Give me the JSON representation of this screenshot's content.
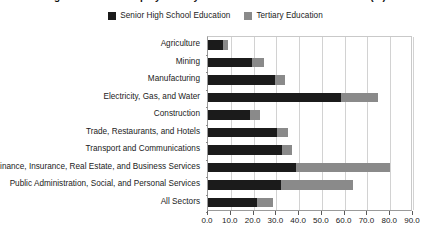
{
  "title": {
    "text": "Figure: Share of Employment by Educational Attainment and Sector (%)"
  },
  "legend": {
    "position": "top-center",
    "items": [
      {
        "label": "Senior High School Education",
        "color": "#1b1b1b",
        "icon": "legend-swatch-icon"
      },
      {
        "label": "Tertiary Education",
        "color": "#8a8a8a",
        "icon": "legend-swatch-icon"
      }
    ]
  },
  "chart_data": {
    "type": "bar",
    "orientation": "horizontal",
    "stacked": true,
    "title": "",
    "xlabel": "",
    "ylabel": "",
    "xlim": [
      0,
      90
    ],
    "xticks": [
      "0.0",
      "10.0",
      "20.0",
      "30.0",
      "40.0",
      "50.0",
      "60.0",
      "70.0",
      "80.0",
      "90.0"
    ],
    "xtick_values": [
      0,
      10,
      20,
      30,
      40,
      50,
      60,
      70,
      80,
      90
    ],
    "grid": true,
    "grid_axis": "x",
    "legend_position": "top-center",
    "categories": [
      "Agriculture",
      "Mining",
      "Manufacturing",
      "Electricity, Gas, and Water",
      "Construction",
      "Trade, Restaurants, and Hotels",
      "Transport and Communications",
      "Finance, Insurance, Real Estate, and Business Services",
      "Public Administration, Social, and Personal Services",
      "All Sectors"
    ],
    "series": [
      {
        "name": "Senior High School Education",
        "color": "#1b1b1b",
        "values": [
          6.5,
          19.5,
          29.5,
          58.5,
          18.5,
          30.5,
          32.5,
          38.5,
          32.0,
          21.5
        ]
      },
      {
        "name": "Tertiary Education",
        "color": "#8a8a8a",
        "values": [
          2.5,
          5.0,
          4.5,
          16.0,
          4.5,
          4.5,
          4.5,
          41.5,
          31.5,
          7.0
        ]
      }
    ],
    "cumulative_totals": [
      9.0,
      24.5,
      34.0,
      74.5,
      23.0,
      35.0,
      37.0,
      80.0,
      63.5,
      28.5
    ]
  },
  "colors": {
    "senior_high": "#1b1b1b",
    "tertiary": "#8a8a8a",
    "gridline": "#d2d2d2",
    "axis": "#9a9a9a",
    "text": "#1a1a1a",
    "background": "#ffffff"
  }
}
